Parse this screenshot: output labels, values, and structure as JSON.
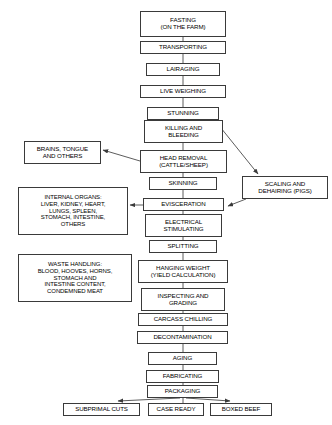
{
  "diagram": {
    "style": {
      "box_border_color": "#3a3a3a",
      "box_fill_color": "#ffffff",
      "text_color": "#000000",
      "edge_color": "#4a4a4a"
    },
    "nodes": [
      {
        "id": "fasting",
        "label": "FASTING\n(ON THE FARM)",
        "x": 140,
        "y": 11,
        "w": 86,
        "h": 26
      },
      {
        "id": "transporting",
        "label": "TRANSPORTING",
        "x": 140,
        "y": 41,
        "w": 86,
        "h": 13
      },
      {
        "id": "lairaging",
        "label": "LAIRAGING",
        "x": 146,
        "y": 63,
        "w": 74,
        "h": 13
      },
      {
        "id": "live-weighing",
        "label": "LIVE WEIGHING",
        "x": 140,
        "y": 85,
        "w": 86,
        "h": 13
      },
      {
        "id": "stunning",
        "label": "STUNNING",
        "x": 147,
        "y": 107,
        "w": 72,
        "h": 13
      },
      {
        "id": "killing-bleeding",
        "label": "KILLING AND\nBLEEDING",
        "x": 144,
        "y": 120,
        "w": 79,
        "h": 23
      },
      {
        "id": "brains-tongue",
        "label": "BRAINS, TONGUE\nAND OTHERS",
        "x": 24,
        "y": 141,
        "w": 77,
        "h": 23
      },
      {
        "id": "head-removal",
        "label": "HEAD REMOVAL\n(CATTLE/SHEEP)",
        "x": 140,
        "y": 150,
        "w": 87,
        "h": 23
      },
      {
        "id": "skinning",
        "label": "SKINNING",
        "x": 149,
        "y": 177,
        "w": 68,
        "h": 13
      },
      {
        "id": "scaling-dehairing",
        "label": "SCALING AND\nDEHAIRING (PIGS)",
        "x": 242,
        "y": 176,
        "w": 86,
        "h": 23
      },
      {
        "id": "internal-organs",
        "label": "INTERNAL ORGANS:\nLIVER, KIDNEY, HEART,\nLUNGS, SPLEEN,\nSTOMACH, INTESTINE,\nOTHERS",
        "x": 18,
        "y": 187,
        "w": 110,
        "h": 48
      },
      {
        "id": "evisceration",
        "label": "EVISCERATION",
        "x": 143,
        "y": 198,
        "w": 81,
        "h": 13
      },
      {
        "id": "electrical-stim",
        "label": "ELECTRICAL\nSTIMULATING",
        "x": 145,
        "y": 214,
        "w": 77,
        "h": 23
      },
      {
        "id": "splitting",
        "label": "SPLITTING",
        "x": 149,
        "y": 240,
        "w": 68,
        "h": 13
      },
      {
        "id": "waste-handling",
        "label": "WASTE HANDLING:\nBLOOD, HOOVES, HORNS,\nSTOMACH AND\nINTESTINE CONTENT,\nCONDEMNED MEAT",
        "x": 18,
        "y": 254,
        "w": 114,
        "h": 48
      },
      {
        "id": "hanging-weight",
        "label": "HANGING WEIGHT\n(YIELD CALCULATION)",
        "x": 138,
        "y": 260,
        "w": 90,
        "h": 23
      },
      {
        "id": "inspecting",
        "label": "INSPECTING AND\nGRADING",
        "x": 141,
        "y": 288,
        "w": 84,
        "h": 23
      },
      {
        "id": "carcass-chilling",
        "label": "CARCASS CHILLING",
        "x": 138,
        "y": 313,
        "w": 90,
        "h": 13
      },
      {
        "id": "decontamination",
        "label": "DECONTAMINATION",
        "x": 137,
        "y": 331,
        "w": 91,
        "h": 13
      },
      {
        "id": "aging",
        "label": "AGING",
        "x": 148,
        "y": 352,
        "w": 69,
        "h": 13
      },
      {
        "id": "fabricating",
        "label": "FABRICATING",
        "x": 146,
        "y": 370,
        "w": 73,
        "h": 13
      },
      {
        "id": "packaging",
        "label": "PACKAGING",
        "x": 147,
        "y": 385,
        "w": 71,
        "h": 13
      },
      {
        "id": "subprimal-cuts",
        "label": "SUBPRIMAL CUTS",
        "x": 63,
        "y": 403,
        "w": 77,
        "h": 13
      },
      {
        "id": "case-ready",
        "label": "CASE READY",
        "x": 148,
        "y": 403,
        "w": 56,
        "h": 13
      },
      {
        "id": "boxed-beef",
        "label": "BOXED BEEF",
        "x": 210,
        "y": 403,
        "w": 62,
        "h": 13
      }
    ],
    "edges": [
      {
        "from": "fasting",
        "to": "transporting",
        "kind": "vertical",
        "arrow": false,
        "x1": 183,
        "y1": 37,
        "x2": 183,
        "y2": 41
      },
      {
        "from": "transporting",
        "to": "lairaging",
        "kind": "vertical",
        "arrow": false,
        "x1": 183,
        "y1": 54,
        "x2": 183,
        "y2": 63
      },
      {
        "from": "lairaging",
        "to": "live-weighing",
        "kind": "vertical",
        "arrow": false,
        "x1": 183,
        "y1": 76,
        "x2": 183,
        "y2": 85
      },
      {
        "from": "live-weighing",
        "to": "stunning",
        "kind": "vertical",
        "arrow": false,
        "x1": 183,
        "y1": 98,
        "x2": 183,
        "y2": 107
      },
      {
        "from": "stunning",
        "to": "killing-bleeding",
        "kind": "vertical",
        "arrow": false,
        "x1": 183,
        "y1": 120,
        "x2": 183,
        "y2": 120
      },
      {
        "from": "killing-bleeding",
        "to": "head-removal",
        "kind": "vertical",
        "arrow": false,
        "x1": 183,
        "y1": 143,
        "x2": 183,
        "y2": 150
      },
      {
        "from": "head-removal",
        "to": "brains-tongue",
        "kind": "diagonal",
        "arrow": true,
        "x1": 140,
        "y1": 161,
        "x2": 103,
        "y2": 150
      },
      {
        "from": "killing-bleeding",
        "to": "scaling-dehairing",
        "kind": "diagonal",
        "arrow": true,
        "x1": 221,
        "y1": 128,
        "x2": 258,
        "y2": 174
      },
      {
        "from": "head-removal",
        "to": "skinning",
        "kind": "vertical",
        "arrow": false,
        "x1": 183,
        "y1": 173,
        "x2": 183,
        "y2": 177
      },
      {
        "from": "skinning",
        "to": "evisceration",
        "kind": "vertical",
        "arrow": false,
        "x1": 183,
        "y1": 190,
        "x2": 183,
        "y2": 198
      },
      {
        "from": "scaling-dehairing",
        "to": "evisceration",
        "kind": "diagonal",
        "arrow": true,
        "x1": 246,
        "y1": 199,
        "x2": 228,
        "y2": 206
      },
      {
        "from": "evisceration",
        "to": "internal-organs",
        "kind": "horizontal",
        "arrow": true,
        "x1": 143,
        "y1": 205,
        "x2": 130,
        "y2": 205
      },
      {
        "from": "evisceration",
        "to": "electrical-stim",
        "kind": "vertical",
        "arrow": false,
        "x1": 183,
        "y1": 211,
        "x2": 183,
        "y2": 214
      },
      {
        "from": "electrical-stim",
        "to": "splitting",
        "kind": "vertical",
        "arrow": false,
        "x1": 183,
        "y1": 237,
        "x2": 183,
        "y2": 240
      },
      {
        "from": "splitting",
        "to": "hanging-weight",
        "kind": "vertical",
        "arrow": false,
        "x1": 183,
        "y1": 253,
        "x2": 183,
        "y2": 260
      },
      {
        "from": "hanging-weight",
        "to": "inspecting",
        "kind": "vertical",
        "arrow": false,
        "x1": 183,
        "y1": 283,
        "x2": 183,
        "y2": 288
      },
      {
        "from": "inspecting",
        "to": "carcass-chilling",
        "kind": "vertical",
        "arrow": false,
        "x1": 183,
        "y1": 311,
        "x2": 183,
        "y2": 313
      },
      {
        "from": "carcass-chilling",
        "to": "decontamination",
        "kind": "vertical",
        "arrow": false,
        "x1": 183,
        "y1": 326,
        "x2": 183,
        "y2": 331
      },
      {
        "from": "decontamination",
        "to": "aging",
        "kind": "vertical",
        "arrow": false,
        "x1": 183,
        "y1": 344,
        "x2": 183,
        "y2": 352
      },
      {
        "from": "aging",
        "to": "fabricating",
        "kind": "vertical",
        "arrow": false,
        "x1": 183,
        "y1": 365,
        "x2": 183,
        "y2": 370
      },
      {
        "from": "fabricating",
        "to": "packaging",
        "kind": "vertical",
        "arrow": false,
        "x1": 183,
        "y1": 383,
        "x2": 183,
        "y2": 385
      },
      {
        "from": "packaging",
        "to": "subprimal-cuts",
        "kind": "diagonal",
        "arrow": true,
        "x1": 180,
        "y1": 398,
        "x2": 118,
        "y2": 401
      },
      {
        "from": "packaging",
        "to": "case-ready",
        "kind": "vertical",
        "arrow": false,
        "x1": 183,
        "y1": 398,
        "x2": 183,
        "y2": 403
      },
      {
        "from": "packaging",
        "to": "boxed-beef",
        "kind": "diagonal",
        "arrow": true,
        "x1": 186,
        "y1": 398,
        "x2": 230,
        "y2": 401
      }
    ]
  }
}
